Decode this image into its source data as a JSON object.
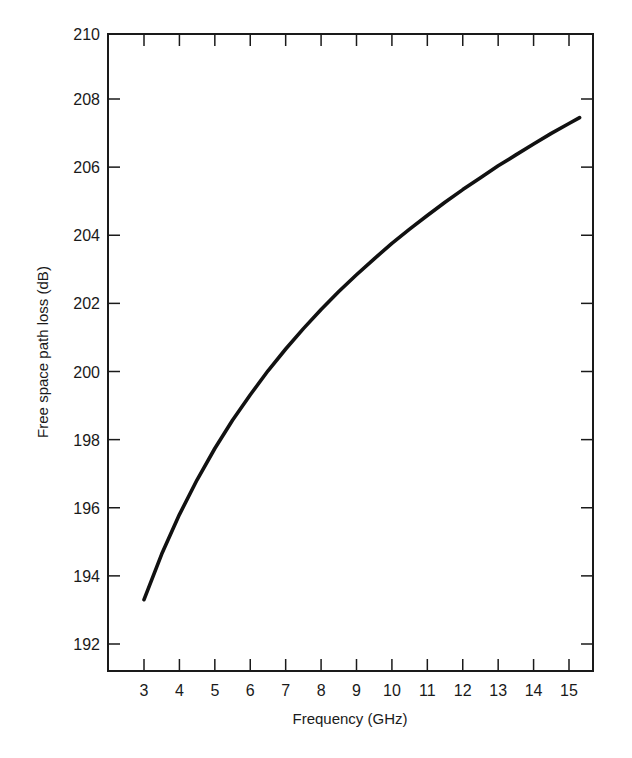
{
  "chart_data": {
    "type": "line",
    "title": "",
    "xlabel": "Frequency (GHz)",
    "ylabel": "Free space path loss (dB)",
    "xlim": [
      1.95,
      15.7
    ],
    "ylim": [
      191.2,
      210
    ],
    "x_ticks": [
      3,
      4,
      5,
      6,
      7,
      8,
      9,
      10,
      11,
      12,
      13,
      14,
      15
    ],
    "y_ticks": [
      192,
      194,
      196,
      198,
      200,
      202,
      204,
      206,
      208,
      210
    ],
    "grid": false,
    "legend": null,
    "series": [
      {
        "name": "Free space path loss",
        "x": [
          3,
          3.5,
          4,
          4.5,
          5,
          5.5,
          6,
          6.5,
          7,
          7.5,
          8,
          8.5,
          9,
          9.5,
          10,
          10.5,
          11,
          11.5,
          12,
          12.5,
          13,
          13.5,
          14,
          14.5,
          15,
          15.3
        ],
        "values": [
          193.3,
          194.64,
          195.8,
          196.82,
          197.74,
          198.57,
          199.32,
          200.02,
          200.66,
          201.26,
          201.82,
          202.35,
          202.84,
          203.31,
          203.76,
          204.18,
          204.58,
          204.97,
          205.34,
          205.69,
          206.04,
          206.36,
          206.68,
          206.99,
          207.28,
          207.45
        ]
      }
    ]
  },
  "colors": {
    "line": "#111111",
    "axis": "#1a1a1a",
    "background": "#ffffff"
  }
}
